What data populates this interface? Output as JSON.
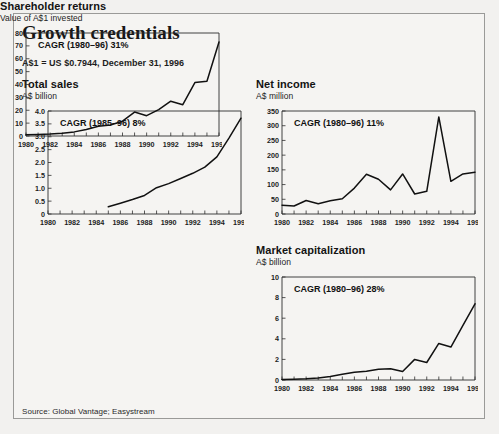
{
  "exhibit": {
    "title": "Growth credentials",
    "fx_note": "A$1 = US $0.7944, December 31, 1996",
    "source": "Source: Global Vantage; Easystream"
  },
  "panels": [
    {
      "id": "total-sales",
      "title": "Total sales",
      "subtitle": "A$ billion",
      "annotation": "CAGR (1985–96) 8%"
    },
    {
      "id": "net-income",
      "title": "Net income",
      "subtitle": "A$ million",
      "annotation": "CAGR (1980–96) 11%"
    },
    {
      "id": "shareholder-returns",
      "title": "Shareholder returns",
      "subtitle": "Value of A$1 invested",
      "annotation": "CAGR (1980–96) 31%"
    },
    {
      "id": "market-capitalization",
      "title": "Market capitalization",
      "subtitle": "A$ billion",
      "annotation": "CAGR (1980–96) 28%"
    }
  ],
  "chart_data": [
    {
      "type": "line",
      "id": "total-sales",
      "title": "Total sales",
      "subtitle": "A$ billion",
      "annotation": "CAGR (1985–96) 8%",
      "xlabel": "",
      "ylabel": "A$ billion",
      "xlim": [
        1980,
        1996
      ],
      "ylim": [
        0,
        4.0
      ],
      "yticks": [
        0,
        0.5,
        1.0,
        1.5,
        2.0,
        2.5,
        3.0,
        3.5,
        4.0
      ],
      "ytick_labels": [
        "0",
        "0.5",
        "1.0",
        "1.5",
        "2.0",
        "2.5",
        "3.0",
        "3.5",
        "4.0"
      ],
      "xticks": [
        1980,
        1982,
        1984,
        1986,
        1988,
        1990,
        1992,
        1994,
        1996
      ],
      "xtick_labels": [
        "1980",
        "1982",
        "1984",
        "1986",
        "1988",
        "1990",
        "1992",
        "1994",
        "1996"
      ],
      "x": [
        1985,
        1986,
        1987,
        1988,
        1989,
        1990,
        1991,
        1992,
        1993,
        1994,
        1995,
        1996
      ],
      "values": [
        0.28,
        0.42,
        0.56,
        0.72,
        1.02,
        1.18,
        1.38,
        1.58,
        1.82,
        2.22,
        2.95,
        3.72
      ],
      "grid": false,
      "legend": "none"
    },
    {
      "type": "line",
      "id": "net-income",
      "title": "Net income",
      "subtitle": "A$ million",
      "annotation": "CAGR (1980–96) 11%",
      "xlabel": "",
      "ylabel": "A$ million",
      "xlim": [
        1980,
        1996
      ],
      "ylim": [
        0,
        350
      ],
      "yticks": [
        0,
        50,
        100,
        150,
        200,
        250,
        300,
        350
      ],
      "ytick_labels": [
        "0",
        "50",
        "100",
        "150",
        "200",
        "250",
        "300",
        "350"
      ],
      "xticks": [
        1980,
        1982,
        1984,
        1986,
        1988,
        1990,
        1992,
        1994,
        1996
      ],
      "xtick_labels": [
        "1980",
        "1982",
        "1984",
        "1986",
        "1988",
        "1990",
        "1992",
        "1994",
        "1996"
      ],
      "x": [
        1980,
        1981,
        1982,
        1983,
        1984,
        1985,
        1986,
        1987,
        1988,
        1989,
        1990,
        1991,
        1992,
        1993,
        1994,
        1995,
        1996
      ],
      "values": [
        30,
        27,
        46,
        35,
        45,
        52,
        88,
        135,
        118,
        82,
        136,
        68,
        77,
        330,
        111,
        136,
        142
      ],
      "grid": false,
      "legend": "none"
    },
    {
      "type": "line",
      "id": "shareholder-returns",
      "title": "Shareholder returns",
      "subtitle": "Value of A$1 invested",
      "annotation": "CAGR (1980–96) 31%",
      "xlabel": "",
      "ylabel": "Value of A$1 invested",
      "xlim": [
        1980,
        1996
      ],
      "ylim": [
        0,
        80
      ],
      "yticks": [
        0,
        10,
        20,
        30,
        40,
        50,
        60,
        70,
        80
      ],
      "ytick_labels": [
        "0",
        "10",
        "20",
        "30",
        "40",
        "50",
        "60",
        "70",
        "80"
      ],
      "xticks": [
        1980,
        1982,
        1984,
        1986,
        1988,
        1990,
        1992,
        1994,
        1996
      ],
      "xtick_labels": [
        "1980",
        "1982",
        "1984",
        "1986",
        "1988",
        "1990",
        "1992",
        "1994",
        "1996"
      ],
      "x": [
        1980,
        1981,
        1982,
        1983,
        1984,
        1985,
        1986,
        1987,
        1988,
        1989,
        1990,
        1991,
        1992,
        1993,
        1994,
        1995,
        1996
      ],
      "values": [
        1,
        1.2,
        1.5,
        2.2,
        3.2,
        5.0,
        7.6,
        8.6,
        11.5,
        18.6,
        15.8,
        20.5,
        27.0,
        24.3,
        41.5,
        42.5,
        73.0
      ],
      "grid": false,
      "legend": "none"
    },
    {
      "type": "line",
      "id": "market-capitalization",
      "title": "Market capitalization",
      "subtitle": "A$ billion",
      "annotation": "CAGR (1980–96) 28%",
      "xlabel": "",
      "ylabel": "A$ billion",
      "xlim": [
        1980,
        1996
      ],
      "ylim": [
        0,
        10
      ],
      "yticks": [
        0,
        2,
        4,
        6,
        8,
        10
      ],
      "ytick_labels": [
        "0",
        "2",
        "4",
        "6",
        "8",
        "10"
      ],
      "xticks": [
        1980,
        1982,
        1984,
        1986,
        1988,
        1990,
        1992,
        1994,
        1996
      ],
      "xtick_labels": [
        "1980",
        "1982",
        "1984",
        "1986",
        "1988",
        "1990",
        "1992",
        "1994",
        "1996"
      ],
      "x": [
        1980,
        1981,
        1982,
        1983,
        1984,
        1985,
        1986,
        1987,
        1988,
        1989,
        1990,
        1991,
        1992,
        1993,
        1994,
        1995,
        1996
      ],
      "values": [
        0.05,
        0.08,
        0.12,
        0.2,
        0.35,
        0.55,
        0.75,
        0.85,
        1.05,
        1.1,
        0.82,
        2.0,
        1.7,
        3.55,
        3.2,
        5.3,
        7.4
      ],
      "grid": false,
      "legend": "none"
    }
  ]
}
